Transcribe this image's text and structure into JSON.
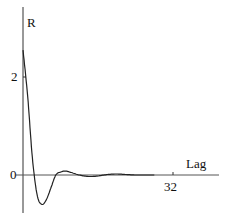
{
  "chart_data": {
    "type": "line",
    "title": "",
    "xlabel": "Lag",
    "ylabel": "R",
    "x_ticks": [
      32
    ],
    "y_ticks": [
      0,
      2
    ],
    "xlim": [
      0,
      40
    ],
    "ylim": [
      -0.9,
      3.6
    ],
    "grid": false,
    "legend": null,
    "series": [
      {
        "name": "R(Lag)",
        "x": [
          0,
          1,
          2,
          3,
          4,
          5,
          6,
          7,
          8,
          9,
          10,
          12,
          14,
          16,
          18,
          20,
          22,
          24,
          26,
          28
        ],
        "values": [
          2.55,
          1.6,
          0.35,
          -0.4,
          -0.6,
          -0.5,
          -0.25,
          0.0,
          0.06,
          0.08,
          0.06,
          0.0,
          -0.03,
          -0.02,
          0.01,
          0.02,
          0.01,
          0.0,
          0.0,
          0.0
        ]
      }
    ]
  },
  "labels": {
    "y_axis": "R",
    "x_axis": "Lag",
    "y_tick_2": "2",
    "y_tick_0": "0",
    "x_tick_32": "32"
  }
}
